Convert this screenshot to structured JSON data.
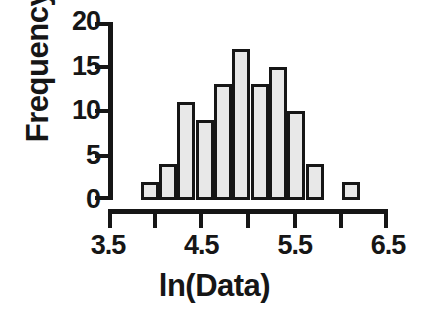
{
  "chart_data": {
    "type": "bar",
    "title": "",
    "subtitle": "",
    "xlabel": "ln(Data)",
    "ylabel": "Frequency",
    "xlim": [
      3.5,
      6.5
    ],
    "ylim": [
      0,
      20
    ],
    "grid": false,
    "legend": null,
    "bin_width": 0.2,
    "x_major_ticks": [
      3.5,
      4.5,
      5.5,
      6.5
    ],
    "x_major_tick_labels": [
      "3.5",
      "4.5",
      "5.5",
      "6.5"
    ],
    "x_minor_ticks": [
      4.0,
      5.0,
      6.0
    ],
    "y_ticks": [
      0,
      5,
      10,
      15,
      20
    ],
    "y_tick_labels": [
      "0",
      "5",
      "10",
      "15",
      "20"
    ],
    "bar_fill_color": "#e8e8e8",
    "bar_edge_color": "#161616",
    "axis_color": "#161616",
    "background_color": "#ffffff",
    "categories": [
      "3.8",
      "4.0",
      "4.2",
      "4.4",
      "4.6",
      "4.8",
      "5.0",
      "5.2",
      "5.4",
      "5.6",
      "5.8",
      "6.0"
    ],
    "bin_starts": [
      3.8,
      4.0,
      4.2,
      4.4,
      4.6,
      4.8,
      5.0,
      5.2,
      5.4,
      5.6,
      5.8,
      6.0
    ],
    "bin_ends": [
      4.0,
      4.2,
      4.4,
      4.6,
      4.8,
      5.0,
      5.2,
      5.4,
      5.6,
      5.8,
      6.0,
      6.2
    ],
    "values": [
      2,
      4,
      11,
      9,
      13,
      17,
      13,
      15,
      10,
      4,
      0,
      2
    ],
    "total_count": 100
  }
}
